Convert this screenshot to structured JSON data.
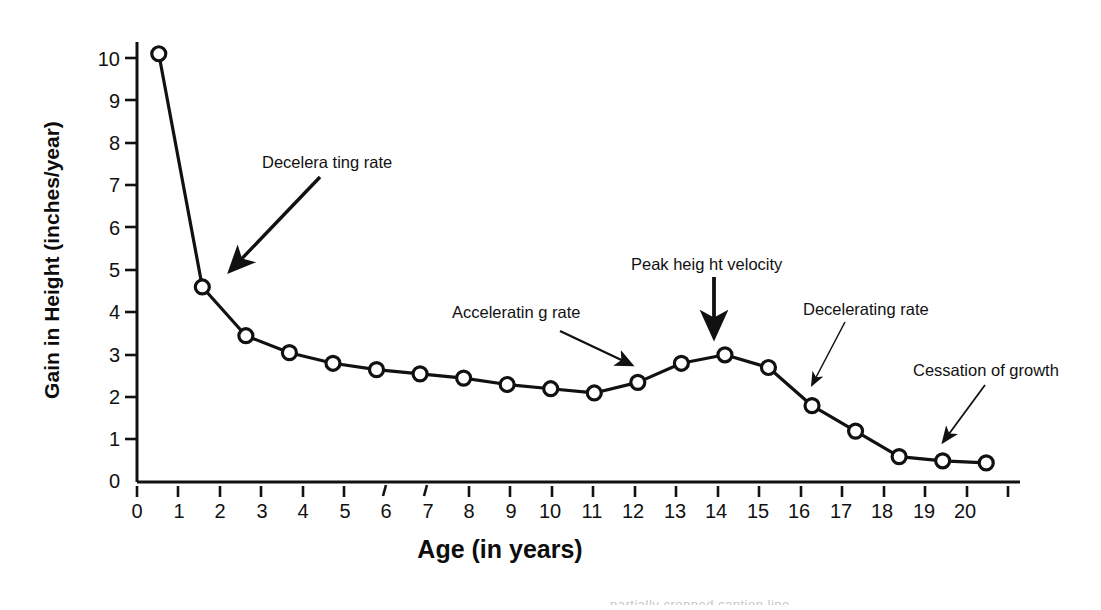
{
  "chart_data": {
    "type": "line",
    "title": "",
    "xlabel": "Age (in years)",
    "ylabel": "Gain in Height (inches/year)",
    "xlim": [
      0,
      20
    ],
    "ylim": [
      0,
      10.6
    ],
    "grid": false,
    "legend_position": "none",
    "marker": "open-circle",
    "xticks": [
      "0",
      "1",
      "2",
      "3",
      "4",
      "5",
      "6",
      "7",
      "8",
      "9",
      "10",
      "11",
      "12",
      "13",
      "14",
      "15",
      "16",
      "17",
      "18",
      "19",
      "20"
    ],
    "yticks": [
      "0",
      "1",
      "2",
      "3",
      "4",
      "5",
      "6",
      "7",
      "8",
      "9",
      "10"
    ],
    "x": [
      0.5,
      1.5,
      2.5,
      3.5,
      4.5,
      5.5,
      6.5,
      7.5,
      8.5,
      9.5,
      10.5,
      11.5,
      12.5,
      13.5,
      14.5,
      15.5,
      16.5,
      17.5,
      18.5,
      19.5
    ],
    "values": [
      10.1,
      4.6,
      3.45,
      3.05,
      2.8,
      2.65,
      2.55,
      2.45,
      2.3,
      2.2,
      2.1,
      2.35,
      2.8,
      3.0,
      2.7,
      1.8,
      1.2,
      0.6,
      0.5,
      0.45
    ],
    "series": [
      {
        "name": "Height velocity",
        "values": [
          10.1,
          4.6,
          3.45,
          3.05,
          2.8,
          2.65,
          2.55,
          2.45,
          2.3,
          2.2,
          2.1,
          2.35,
          2.8,
          3.0,
          2.7,
          1.8,
          1.2,
          0.6,
          0.5,
          0.45
        ]
      }
    ],
    "annotations": [
      {
        "id": "decelerating-rate-early",
        "text": "Decelera ting rate",
        "points_to_x": 1.9,
        "points_to_y": 4.5
      },
      {
        "id": "accelerating-rate",
        "text": "Acceleratin g rate",
        "points_to_x": 11.2,
        "points_to_y": 2.6
      },
      {
        "id": "peak-height-velocity",
        "text": "Peak heig ht velocity",
        "points_to_x": 13.5,
        "points_to_y": 3.4
      },
      {
        "id": "decelerating-rate-late",
        "text": "Decelerating rate",
        "points_to_x": 15.6,
        "points_to_y": 2.0
      },
      {
        "id": "cessation-of-growth",
        "text": "Cessation of growth",
        "points_to_x": 19.3,
        "points_to_y": 0.85
      }
    ]
  },
  "footer": {
    "cropped_text": "partially cropped caption line"
  }
}
